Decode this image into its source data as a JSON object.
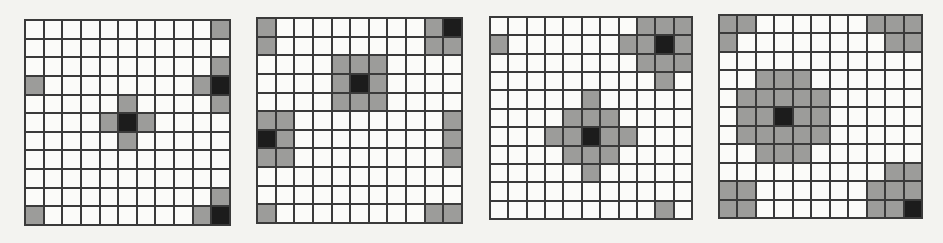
{
  "colors": {
    "empty": "#fbfbf9",
    "gray": "#9c9c9a",
    "black": "#1c1c1c",
    "line": "#3a3a3a",
    "background": "#f3f3f0"
  },
  "legend": {
    "0": "empty",
    "1": "gray",
    "2": "black"
  },
  "grids": [
    {
      "name": "grid-1",
      "pos": {
        "left": 24,
        "top": 19,
        "size": 207
      },
      "cells": [
        [
          0,
          0,
          0,
          0,
          0,
          0,
          0,
          0,
          0,
          0,
          1
        ],
        [
          0,
          0,
          0,
          0,
          0,
          0,
          0,
          0,
          0,
          0,
          0
        ],
        [
          0,
          0,
          0,
          0,
          0,
          0,
          0,
          0,
          0,
          0,
          1
        ],
        [
          1,
          0,
          0,
          0,
          0,
          0,
          0,
          0,
          0,
          1,
          2
        ],
        [
          0,
          0,
          0,
          0,
          0,
          1,
          0,
          0,
          0,
          0,
          1
        ],
        [
          0,
          0,
          0,
          0,
          1,
          2,
          1,
          0,
          0,
          0,
          0
        ],
        [
          0,
          0,
          0,
          0,
          0,
          1,
          0,
          0,
          0,
          0,
          0
        ],
        [
          0,
          0,
          0,
          0,
          0,
          0,
          0,
          0,
          0,
          0,
          0
        ],
        [
          0,
          0,
          0,
          0,
          0,
          0,
          0,
          0,
          0,
          0,
          0
        ],
        [
          0,
          0,
          0,
          0,
          0,
          0,
          0,
          0,
          0,
          0,
          1
        ],
        [
          1,
          0,
          0,
          0,
          0,
          0,
          0,
          0,
          0,
          1,
          2
        ]
      ]
    },
    {
      "name": "grid-2",
      "pos": {
        "left": 256,
        "top": 17,
        "size": 207
      },
      "cells": [
        [
          1,
          0,
          0,
          0,
          0,
          0,
          0,
          0,
          0,
          1,
          2
        ],
        [
          1,
          0,
          0,
          0,
          0,
          0,
          0,
          0,
          0,
          1,
          1
        ],
        [
          0,
          0,
          0,
          0,
          1,
          1,
          1,
          0,
          0,
          0,
          0
        ],
        [
          0,
          0,
          0,
          0,
          1,
          2,
          1,
          0,
          0,
          0,
          0
        ],
        [
          0,
          0,
          0,
          0,
          1,
          1,
          1,
          0,
          0,
          0,
          0
        ],
        [
          1,
          1,
          0,
          0,
          0,
          0,
          0,
          0,
          0,
          0,
          1
        ],
        [
          2,
          1,
          0,
          0,
          0,
          0,
          0,
          0,
          0,
          0,
          1
        ],
        [
          1,
          1,
          0,
          0,
          0,
          0,
          0,
          0,
          0,
          0,
          1
        ],
        [
          0,
          0,
          0,
          0,
          0,
          0,
          0,
          0,
          0,
          0,
          0
        ],
        [
          0,
          0,
          0,
          0,
          0,
          0,
          0,
          0,
          0,
          0,
          0
        ],
        [
          1,
          0,
          0,
          0,
          0,
          0,
          0,
          0,
          0,
          1,
          1
        ]
      ]
    },
    {
      "name": "grid-3",
      "pos": {
        "left": 489,
        "top": 16,
        "size": 204
      },
      "cells": [
        [
          0,
          0,
          0,
          0,
          0,
          0,
          0,
          0,
          1,
          1,
          1
        ],
        [
          1,
          0,
          0,
          0,
          0,
          0,
          0,
          1,
          1,
          2,
          1
        ],
        [
          0,
          0,
          0,
          0,
          0,
          0,
          0,
          0,
          1,
          1,
          1
        ],
        [
          0,
          0,
          0,
          0,
          0,
          0,
          0,
          0,
          0,
          1,
          0
        ],
        [
          0,
          0,
          0,
          0,
          0,
          1,
          0,
          0,
          0,
          0,
          0
        ],
        [
          0,
          0,
          0,
          0,
          1,
          1,
          1,
          0,
          0,
          0,
          0
        ],
        [
          0,
          0,
          0,
          1,
          1,
          2,
          1,
          1,
          0,
          0,
          0
        ],
        [
          0,
          0,
          0,
          0,
          1,
          1,
          1,
          0,
          0,
          0,
          0
        ],
        [
          0,
          0,
          0,
          0,
          0,
          1,
          0,
          0,
          0,
          0,
          0
        ],
        [
          0,
          0,
          0,
          0,
          0,
          0,
          0,
          0,
          0,
          0,
          0
        ],
        [
          0,
          0,
          0,
          0,
          0,
          0,
          0,
          0,
          0,
          1,
          0
        ]
      ]
    },
    {
      "name": "grid-4",
      "pos": {
        "left": 718,
        "top": 14,
        "size": 205
      },
      "cells": [
        [
          1,
          1,
          0,
          0,
          0,
          0,
          0,
          0,
          1,
          1,
          1
        ],
        [
          1,
          0,
          0,
          0,
          0,
          0,
          0,
          0,
          0,
          1,
          1
        ],
        [
          0,
          0,
          0,
          0,
          0,
          0,
          0,
          0,
          0,
          0,
          0
        ],
        [
          0,
          0,
          1,
          1,
          1,
          0,
          0,
          0,
          0,
          0,
          0
        ],
        [
          0,
          1,
          1,
          1,
          1,
          1,
          0,
          0,
          0,
          0,
          0
        ],
        [
          0,
          1,
          1,
          2,
          1,
          1,
          0,
          0,
          0,
          0,
          0
        ],
        [
          0,
          1,
          1,
          1,
          1,
          1,
          0,
          0,
          0,
          0,
          0
        ],
        [
          0,
          0,
          1,
          1,
          1,
          0,
          0,
          0,
          0,
          0,
          0
        ],
        [
          0,
          0,
          0,
          0,
          0,
          0,
          0,
          0,
          0,
          1,
          1
        ],
        [
          1,
          1,
          0,
          0,
          0,
          0,
          0,
          0,
          1,
          1,
          1
        ],
        [
          1,
          1,
          0,
          0,
          0,
          0,
          0,
          0,
          1,
          1,
          2
        ]
      ]
    }
  ]
}
